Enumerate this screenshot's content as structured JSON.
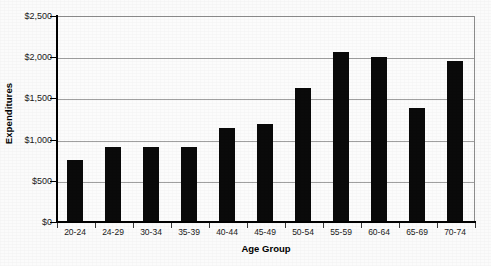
{
  "chart_data": {
    "type": "bar",
    "title": "",
    "subtitle": "",
    "xlabel": "Age Group",
    "ylabel": "Expenditures",
    "categories": [
      "20-24",
      "24-29",
      "30-34",
      "35-39",
      "40-44",
      "45-49",
      "50-54",
      "55-59",
      "60-64",
      "65-69",
      "70-74"
    ],
    "values": [
      750,
      910,
      915,
      910,
      1135,
      1190,
      1630,
      2060,
      2000,
      1380,
      1960
    ],
    "ylim": [
      0,
      2500
    ],
    "ytick_values": [
      0,
      500,
      1000,
      1500,
      2000,
      2500
    ],
    "ytick_labels": [
      "$0",
      "$500",
      "$1,000",
      "$1,500",
      "$2,000",
      "$2,500"
    ],
    "grid": true,
    "grid_axis": "y",
    "legend": false,
    "legend_position": "none",
    "bar_color": "#0a0a0a",
    "grid_color": "#a0a0a0",
    "axis_color": "#000000",
    "background_color": "#fbfbfb",
    "plot_background_color": "#fcfcfc",
    "series": [
      {
        "name": "Expenditures",
        "values": [
          750,
          910,
          915,
          910,
          1135,
          1190,
          1630,
          2060,
          2000,
          1380,
          1960
        ]
      }
    ],
    "points": [
      {
        "category": "20-24",
        "value": 750
      },
      {
        "category": "24-29",
        "value": 910
      },
      {
        "category": "30-34",
        "value": 915
      },
      {
        "category": "35-39",
        "value": 910
      },
      {
        "category": "40-44",
        "value": 1135
      },
      {
        "category": "45-49",
        "value": 1190
      },
      {
        "category": "50-54",
        "value": 1630
      },
      {
        "category": "55-59",
        "value": 2060
      },
      {
        "category": "60-64",
        "value": 2000
      },
      {
        "category": "65-69",
        "value": 1380
      },
      {
        "category": "70-74",
        "value": 1960
      }
    ]
  }
}
